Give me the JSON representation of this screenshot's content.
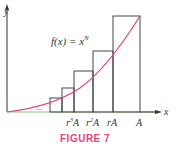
{
  "figure": {
    "caption": "FIGURE 7",
    "function_label": "f(x) = x",
    "function_exponent": "N",
    "axis_x_label": "x",
    "axis_y_label": "y",
    "ellipsis": "...",
    "ticks": [
      {
        "base": "r",
        "sup": "3",
        "tail": "A"
      },
      {
        "base": "r",
        "sup": "2",
        "tail": "A"
      },
      {
        "base": "rA",
        "sup": "",
        "tail": ""
      },
      {
        "base": "A",
        "sup": "",
        "tail": ""
      }
    ],
    "colors": {
      "curve": "#e0457b",
      "axis": "#333333",
      "rect": "#333333",
      "caption": "#e0457b",
      "x_axis_tint": "#8fc77a"
    }
  }
}
